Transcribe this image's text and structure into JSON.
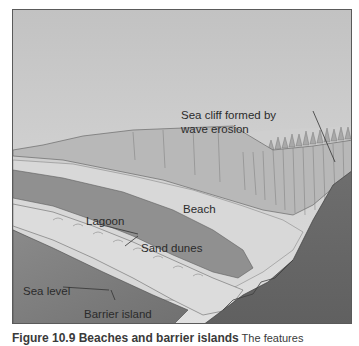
{
  "figure": {
    "labels": {
      "sea_cliff_line1": "Sea cliff formed by",
      "sea_cliff_line2": "wave erosion",
      "beach": "Beach",
      "lagoon": "Lagoon",
      "sand_dunes": "Sand dunes",
      "sea_level": "Sea level",
      "barrier_island": "Barrier island"
    },
    "colors": {
      "sky_top": "#c4c4c4",
      "sky_bottom": "#dedede",
      "sea": "#7d7d7d",
      "deep_water": "#6a6a6a",
      "lagoon": "#8f8f8f",
      "sand": "#d6d6d6",
      "cliff": "#b4b4b4",
      "border": "#5a5a5a"
    }
  },
  "caption": {
    "title": "Figure 10.9  Beaches and barrier islands",
    "rest": "  The features"
  }
}
